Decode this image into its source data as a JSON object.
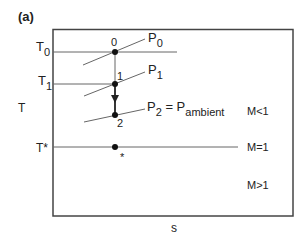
{
  "panel_label": "(a)",
  "axes": {
    "y_label": "T",
    "x_label": "s"
  },
  "temperature_levels": [
    {
      "name": "T",
      "sub": "0",
      "y": 52,
      "x_end": 177
    },
    {
      "name": "T",
      "sub": "1",
      "y": 84,
      "x_end": 115
    },
    {
      "name": "T*",
      "sub": "",
      "y": 147,
      "x_end": 238
    }
  ],
  "isobars": [
    {
      "name": "P",
      "sub": "0",
      "suffix": "",
      "suffix_sub": ""
    },
    {
      "name": "P",
      "sub": "1",
      "suffix": "",
      "suffix_sub": ""
    },
    {
      "name": "P",
      "sub": "2",
      "suffix": " = P",
      "suffix_sub": "ambient"
    }
  ],
  "points": [
    {
      "label": "0",
      "x": 115,
      "y": 52
    },
    {
      "label": "1",
      "x": 115,
      "y": 84
    },
    {
      "label": "2",
      "x": 115,
      "y": 115
    },
    {
      "label": "*",
      "x": 115,
      "y": 147
    }
  ],
  "regions": [
    {
      "label": "M<1"
    },
    {
      "label": "M=1"
    },
    {
      "label": "M>1"
    }
  ],
  "colors": {
    "frame": "#444444",
    "line": "#666666",
    "point": "#111111"
  }
}
